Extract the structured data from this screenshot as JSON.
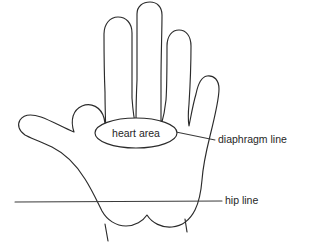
{
  "figure": {
    "type": "anatomical-hand-reflexology-diagram",
    "background_color": "#ffffff",
    "stroke_color": "#2b2b2b",
    "text_color": "#262626",
    "width": 313,
    "height": 250
  },
  "regions": [
    {
      "id": "heart-area",
      "label": "heart area",
      "shape": "ellipse",
      "center_x": 136,
      "center_y": 133,
      "radius_x": 41,
      "radius_y": 15
    }
  ],
  "guide_lines": [
    {
      "id": "diaphragm-line",
      "label": "diaphragm line",
      "label_x": 218,
      "label_y": 140,
      "y": 140,
      "leader_start_x": 178,
      "leader_end_x": 215
    },
    {
      "id": "hip-line",
      "label": "hip line",
      "label_x": 225,
      "label_y": 201,
      "y": 201,
      "leader_start_x": 15,
      "leader_end_x": 222
    }
  ],
  "anatomy": {
    "outline_name": "hand-outline",
    "digits": [
      "thumb",
      "index-finger",
      "middle-finger",
      "ring-finger",
      "little-finger"
    ],
    "wrist_marks": 2
  }
}
